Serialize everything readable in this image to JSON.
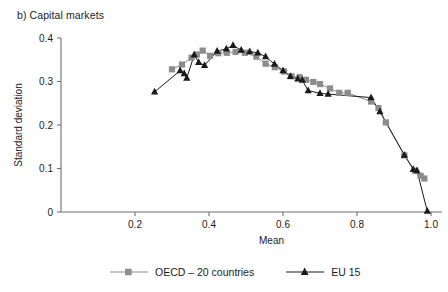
{
  "figure": {
    "panel_title": "b) Capital markets"
  },
  "chart_data": {
    "type": "line",
    "title": "b) Capital markets",
    "xlabel": "Mean",
    "ylabel": "Standard deviation",
    "xlim": [
      0.0,
      1.05
    ],
    "ylim": [
      0.0,
      0.42
    ],
    "xticks": [
      0.2,
      0.4,
      0.6,
      0.8,
      1.0
    ],
    "xtick_labels": [
      "0.2",
      "0.4",
      "0.6",
      "0.8",
      "1.0"
    ],
    "yticks": [
      0.0,
      0.1,
      0.2,
      0.3,
      0.4
    ],
    "ytick_labels": [
      "0",
      "0.1",
      "0.2",
      "0.3",
      "0.4"
    ],
    "grid": false,
    "legend_position": "bottom",
    "series": [
      {
        "name": "OECD – 20 countries",
        "color": "#8c8c8c",
        "marker": "square",
        "points": [
          [
            0.3,
            0.328
          ],
          [
            0.327,
            0.339
          ],
          [
            0.353,
            0.355
          ],
          [
            0.367,
            0.362
          ],
          [
            0.383,
            0.371
          ],
          [
            0.403,
            0.359
          ],
          [
            0.425,
            0.365
          ],
          [
            0.448,
            0.366
          ],
          [
            0.472,
            0.368
          ],
          [
            0.497,
            0.366
          ],
          [
            0.528,
            0.357
          ],
          [
            0.553,
            0.341
          ],
          [
            0.578,
            0.333
          ],
          [
            0.603,
            0.323
          ],
          [
            0.623,
            0.312
          ],
          [
            0.645,
            0.31
          ],
          [
            0.662,
            0.304
          ],
          [
            0.682,
            0.299
          ],
          [
            0.7,
            0.294
          ],
          [
            0.727,
            0.284
          ],
          [
            0.752,
            0.274
          ],
          [
            0.775,
            0.274
          ],
          [
            0.838,
            0.254
          ],
          [
            0.858,
            0.239
          ],
          [
            0.878,
            0.206
          ],
          [
            0.928,
            0.13
          ],
          [
            0.957,
            0.095
          ],
          [
            0.972,
            0.083
          ],
          [
            0.982,
            0.077
          ]
        ]
      },
      {
        "name": "EU 15",
        "color": "#1a1a1a",
        "marker": "triangle",
        "points": [
          [
            0.253,
            0.276
          ],
          [
            0.322,
            0.325
          ],
          [
            0.333,
            0.318
          ],
          [
            0.34,
            0.308
          ],
          [
            0.36,
            0.361
          ],
          [
            0.372,
            0.344
          ],
          [
            0.388,
            0.337
          ],
          [
            0.422,
            0.37
          ],
          [
            0.447,
            0.375
          ],
          [
            0.465,
            0.383
          ],
          [
            0.487,
            0.372
          ],
          [
            0.51,
            0.369
          ],
          [
            0.532,
            0.366
          ],
          [
            0.553,
            0.357
          ],
          [
            0.577,
            0.34
          ],
          [
            0.6,
            0.325
          ],
          [
            0.62,
            0.312
          ],
          [
            0.64,
            0.306
          ],
          [
            0.652,
            0.303
          ],
          [
            0.668,
            0.279
          ],
          [
            0.7,
            0.273
          ],
          [
            0.722,
            0.271
          ],
          [
            0.838,
            0.263
          ],
          [
            0.862,
            0.231
          ],
          [
            0.928,
            0.131
          ],
          [
            0.952,
            0.098
          ],
          [
            0.962,
            0.095
          ],
          [
            0.99,
            0.002
          ]
        ]
      }
    ]
  },
  "legend": {
    "items": [
      {
        "label": "OECD – 20 countries",
        "color": "#8c8c8c",
        "marker": "square"
      },
      {
        "label": "EU 15",
        "color": "#1a1a1a",
        "marker": "triangle"
      }
    ]
  }
}
